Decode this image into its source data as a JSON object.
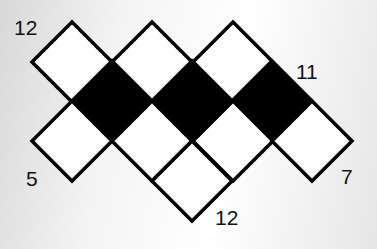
{
  "puzzle": {
    "cell_half_size": 40,
    "stroke_width": 3.5,
    "colors": {
      "white": "#ffffff",
      "black": "#000000",
      "stroke": "#000000"
    },
    "cells": [
      {
        "cx": 72,
        "cy": 62,
        "fill": "white"
      },
      {
        "cx": 152,
        "cy": 62,
        "fill": "white"
      },
      {
        "cx": 233,
        "cy": 62,
        "fill": "white"
      },
      {
        "cx": 112,
        "cy": 101,
        "fill": "black"
      },
      {
        "cx": 192,
        "cy": 101,
        "fill": "black"
      },
      {
        "cx": 272,
        "cy": 101,
        "fill": "black"
      },
      {
        "cx": 72,
        "cy": 141,
        "fill": "white"
      },
      {
        "cx": 152,
        "cy": 141,
        "fill": "white"
      },
      {
        "cx": 233,
        "cy": 141,
        "fill": "white"
      },
      {
        "cx": 312,
        "cy": 141,
        "fill": "white"
      },
      {
        "cx": 192,
        "cy": 181,
        "fill": "white"
      }
    ]
  },
  "clues": {
    "top_left": "12",
    "top_right": "11",
    "bottom_left": "5",
    "bottom_middle": "12",
    "bottom_right": "7"
  }
}
